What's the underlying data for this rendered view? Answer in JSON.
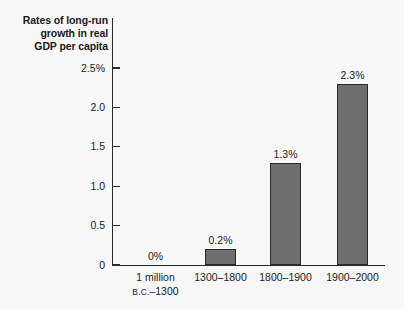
{
  "chart_data": {
    "type": "bar",
    "title": "Rates of long-run\ngrowth in real\nGDP per capita",
    "xlabel": "",
    "ylabel": "",
    "categories": [
      "1 million B.C.–1300",
      "1300–1800",
      "1800–1900",
      "1900–2000"
    ],
    "values": [
      0,
      0.2,
      1.3,
      2.3
    ],
    "data_labels": [
      "0%",
      "0.2%",
      "1.3%",
      "2.3%"
    ],
    "ylim": [
      0,
      2.5
    ],
    "y_ticks": [
      0,
      0.5,
      1.0,
      1.5,
      2.0,
      2.5
    ],
    "y_tick_labels": [
      "0",
      "0.5",
      "1.0",
      "1.5",
      "2.0",
      "2.5%"
    ],
    "grid": false,
    "legend": false,
    "bar_color": "#6e6e6e",
    "bar_border_color": "#2b2b2b",
    "axis_color": "#2b2b2b",
    "background_color": "#f8f8f8"
  },
  "x_axis": {
    "labels": [
      {
        "line1": "1 million",
        "line2_prefix": "B.C.",
        "line2_rest": "–1300"
      },
      {
        "line1": "1300–1800",
        "line2_prefix": "",
        "line2_rest": ""
      },
      {
        "line1": "1800–1900",
        "line2_prefix": "",
        "line2_rest": ""
      },
      {
        "line1": "1900–2000",
        "line2_prefix": "",
        "line2_rest": ""
      }
    ]
  }
}
